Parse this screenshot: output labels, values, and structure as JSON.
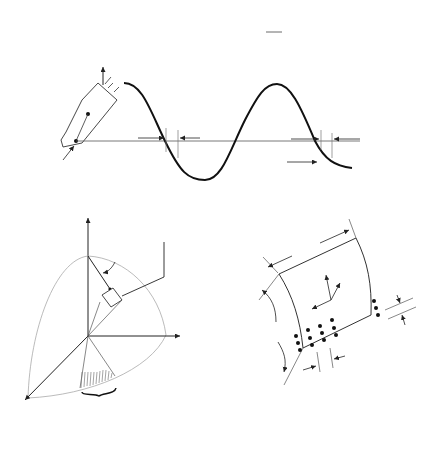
{
  "equation": {
    "lhs": "G(X,Y,Z) = Σ W",
    "sub_i": "i",
    "s": " S",
    "r": " (R",
    "rclose": ")e",
    "exp": "-j",
    "frac_num": "4π",
    "frac_den": "λ",
    "tail": " R"
  },
  "top_panel": {
    "sensor_label": "R(X,Y,Z,t",
    "sensor_label_sub": "i",
    "sensor_label_close": ")",
    "rlos_label": "RLOS",
    "delta_t_1": "Δt",
    "delta_t_2": "Δt",
    "time_label": "t",
    "time_sub": "i"
  },
  "left_panel": {
    "omega_label": "Ω",
    "z_label": "Z",
    "y_label": "Y",
    "x_label": "X",
    "psi_label": "ψ",
    "kappa_label": "κ",
    "volume_eq": "|G(X,Y,Z)|",
    "volume_eq_rhs": " = f(X,Y,Z)",
    "plane_eq": "|G(X,Y,Z)|",
    "plane_eq_rhs": " = f(X,Y)",
    "sq": "2"
  },
  "right_panel": {
    "d_theta_big": "Dθ",
    "d_kappa_big": "Dκ",
    "z_prime": "Z'",
    "y_prime": "Y'",
    "x_prime": "X'",
    "d_theta_small": "dθ",
    "d_kappa_small": "dκ"
  },
  "resolutions": {
    "eq1": "dθ = dθ sin κ",
    "label": "Resolutions:",
    "eq2": "δX' = 1.8λ /2Dθ",
    "eq3": "δZ' = 1.8λ /2Dκ"
  }
}
